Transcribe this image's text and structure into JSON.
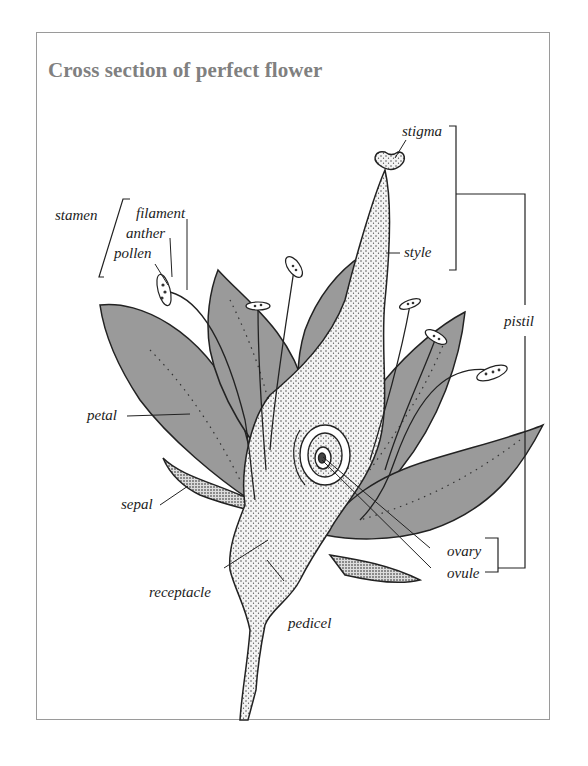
{
  "title": "Cross section of perfect flower",
  "labels": {
    "stamen": "stamen",
    "filament": "filament",
    "anther": "anther",
    "pollen": "pollen",
    "stigma": "stigma",
    "style": "style",
    "pistil": "pistil",
    "petal": "petal",
    "sepal": "sepal",
    "ovary": "ovary",
    "ovule": "ovule",
    "receptacle": "receptacle",
    "pedicel": "pedicel"
  },
  "groups": {
    "stamen": [
      "filament",
      "anther",
      "pollen"
    ],
    "pistil": [
      "stigma",
      "style",
      "ovary",
      "ovule"
    ]
  },
  "colors": {
    "petal_fill": "#9a9a9a",
    "title": "#808080",
    "frame": "#9a9a9a",
    "ink": "#222222"
  }
}
